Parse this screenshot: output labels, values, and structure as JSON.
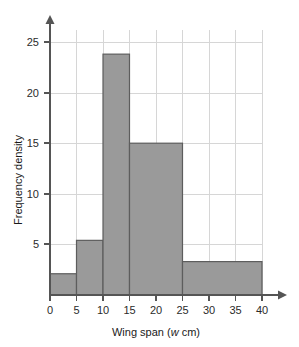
{
  "chart_data": {
    "type": "bar",
    "title": "",
    "xlabel": "Wing span (w cm)",
    "xlabel_plain": "Wing span (",
    "xlabel_variable": "w",
    "xlabel_unit": " cm)",
    "ylabel": "Frequency density",
    "xlim": [
      0,
      40
    ],
    "ylim": [
      0,
      26.5
    ],
    "grid": true,
    "legend": "none",
    "xticks": [
      0,
      5,
      10,
      15,
      20,
      25,
      30,
      35,
      40
    ],
    "xtick_labels": [
      "0",
      "5",
      "10",
      "15",
      "20",
      "25",
      "30",
      "35",
      "40"
    ],
    "yticks": [
      5,
      10,
      15,
      20,
      25
    ],
    "ytick_labels": [
      "5",
      "10",
      "15",
      "20",
      "25"
    ],
    "bin_edges": [
      0,
      5,
      10,
      15,
      25,
      40
    ],
    "bins": [
      {
        "label": "0-5",
        "x0": 0,
        "x1": 5,
        "value": 2.1
      },
      {
        "label": "5-10",
        "x0": 5,
        "x1": 10,
        "value": 5.4
      },
      {
        "label": "10-15",
        "x0": 10,
        "x1": 15,
        "value": 23.8
      },
      {
        "label": "15-25",
        "x0": 15,
        "x1": 25,
        "value": 15.0
      },
      {
        "label": "25-40",
        "x0": 25,
        "x1": 40,
        "value": 3.3
      }
    ],
    "colors": {
      "bar_fill": "#9a9a9a",
      "bar_border": "#5d5d5d",
      "gridline": "#d6d6d6",
      "axis": "#555555",
      "text": "#1a1a1a",
      "background": "#ffffff"
    }
  }
}
